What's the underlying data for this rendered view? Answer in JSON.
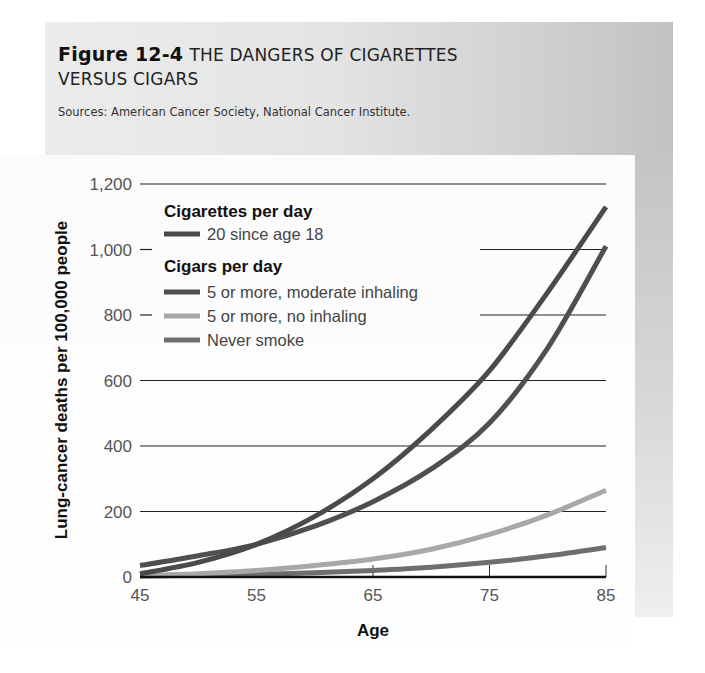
{
  "figure": {
    "number": "Figure 12-4",
    "title_line1": "THE DANGERS OF CIGARETTES",
    "title_line2": "VERSUS CIGARS",
    "source": "Sources: American Cancer Society, National Cancer Institute."
  },
  "legend": {
    "group1_heading": "Cigarettes per day",
    "group2_heading": "Cigars per day",
    "items": [
      {
        "label": "20 since age 18",
        "color": "#4a4a4a"
      },
      {
        "label": "5 or more, moderate inhaling",
        "color": "#4f4f4f"
      },
      {
        "label": "5 or more, no inhaling",
        "color": "#a8a8a8"
      },
      {
        "label": "Never smoke",
        "color": "#6e6e6e"
      }
    ]
  },
  "axes": {
    "xlabel": "Age",
    "ylabel": "Lung-cancer deaths per 100,000 people",
    "xticks": [
      "45",
      "55",
      "65",
      "75",
      "85"
    ],
    "yticks": [
      "0",
      "200",
      "400",
      "600",
      "800",
      "1,000",
      "1,200"
    ]
  },
  "chart_data": {
    "type": "line",
    "title": "Figure 12-4 THE DANGERS OF CIGARETTES VERSUS CIGARS",
    "subtitle": "Sources: American Cancer Society, National Cancer Institute.",
    "xlabel": "Age",
    "ylabel": "Lung-cancer deaths per 100,000 people",
    "xlim": [
      45,
      85
    ],
    "ylim": [
      0,
      1200
    ],
    "x_ticks": [
      45,
      55,
      65,
      75,
      85
    ],
    "y_ticks": [
      0,
      200,
      400,
      600,
      800,
      1000,
      1200
    ],
    "grid": "horizontal lines at each y tick (partially interrupted by legend)",
    "legend_position": "upper left, inside plot",
    "x": [
      45,
      50,
      55,
      60,
      65,
      70,
      75,
      80,
      85
    ],
    "series": [
      {
        "name": "Cigarettes per day: 20 since age 18",
        "values": [
          10,
          45,
          100,
          185,
          300,
          450,
          630,
          870,
          1130
        ]
      },
      {
        "name": "Cigars per day: 5 or more, moderate inhaling",
        "values": [
          35,
          65,
          100,
          155,
          230,
          330,
          470,
          700,
          1010
        ]
      },
      {
        "name": "Cigars per day: 5 or more, no inhaling",
        "values": [
          5,
          10,
          20,
          35,
          55,
          85,
          130,
          190,
          265
        ]
      },
      {
        "name": "Never smoke",
        "values": [
          3,
          5,
          8,
          13,
          20,
          30,
          45,
          65,
          90
        ]
      }
    ]
  }
}
